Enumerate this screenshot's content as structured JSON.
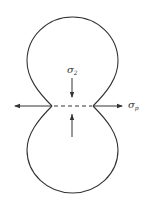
{
  "diagram": {
    "type": "stress-distribution-lobes",
    "labels": {
      "sigma2": {
        "symbol": "σ",
        "subscript": "2"
      },
      "sigmap": {
        "symbol": "σ",
        "subscript": "p"
      }
    },
    "colors": {
      "stroke": "#333333",
      "background": "#ffffff"
    }
  }
}
